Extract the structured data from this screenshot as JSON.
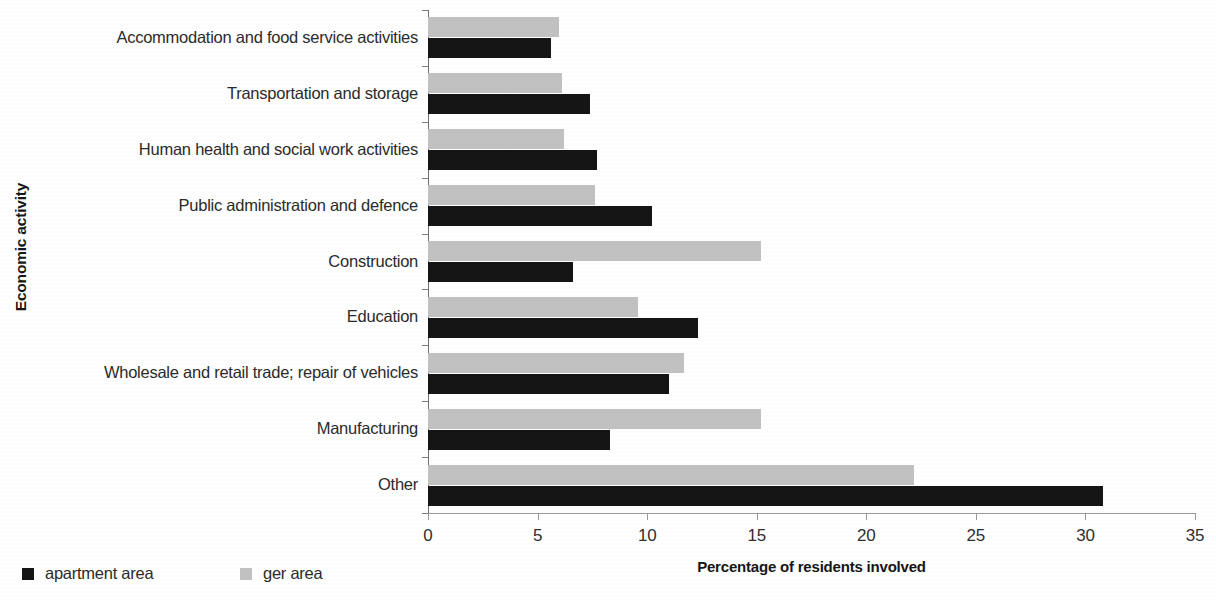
{
  "chart_data": {
    "type": "bar",
    "orientation": "horizontal",
    "title": "",
    "xlabel": "Percentage of residents involved",
    "ylabel": "Economic activity",
    "xlim": [
      0,
      35
    ],
    "xticks": [
      0,
      5,
      10,
      15,
      20,
      25,
      30,
      35
    ],
    "xtick_labels": [
      "0",
      "5",
      "10",
      "15",
      "20",
      "25",
      "30",
      "35"
    ],
    "grid": false,
    "legend_position": "bottom-left",
    "categories": [
      "Accommodation and food service activities",
      "Transportation and storage",
      "Human health and social work activities",
      "Public administration and defence",
      "Construction",
      "Education",
      "Wholesale and retail trade; repair of vehicles",
      "Manufacturing",
      "Other"
    ],
    "series": [
      {
        "name": "apartment area",
        "color": "#151515",
        "values": [
          5.6,
          7.4,
          7.7,
          10.2,
          6.6,
          12.3,
          11.0,
          8.3,
          30.8
        ]
      },
      {
        "name": "ger area",
        "color": "#c2c2c2",
        "values": [
          6.0,
          6.1,
          6.2,
          7.6,
          15.2,
          9.6,
          11.7,
          15.2,
          22.2
        ]
      }
    ]
  },
  "legend": {
    "items": [
      {
        "label": "apartment area",
        "swatch": "black-square-icon",
        "color": "#151515"
      },
      {
        "label": "ger area",
        "swatch": "gray-square-icon",
        "color": "#c2c2c2"
      }
    ]
  },
  "axes": {
    "x_title": "Percentage of residents involved",
    "y_title": "Economic activity"
  }
}
